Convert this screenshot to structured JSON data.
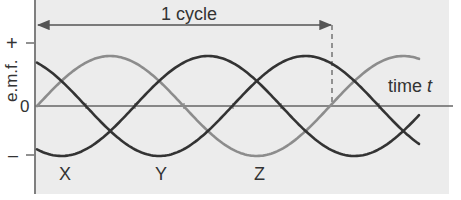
{
  "figure": {
    "type": "three-phase e.m.f. waveform diagram",
    "colors": {
      "panel_background": "#ececec",
      "axis": "#555555",
      "curve_dark": "#333333",
      "curve_light": "#8c8c8c",
      "text": "#333333"
    }
  },
  "axes": {
    "y_label": "e.m.f.",
    "y_tick_plus": "+",
    "y_tick_zero": "0",
    "y_tick_minus": "–",
    "x_label": "time",
    "x_label_var": "t"
  },
  "annotation": {
    "cycle_label": "1 cycle"
  },
  "curve_labels": {
    "x": "X",
    "y": "Y",
    "z": "Z"
  },
  "chart_data": {
    "type": "line",
    "title": "",
    "xlabel": "time t",
    "ylabel": "e.m.f.",
    "y_ticks": [
      "+",
      "0",
      "–"
    ],
    "annotations": [
      "1 cycle (double-headed arrow spanning one period, dashed marker at end)"
    ],
    "x_units": "degrees of phase",
    "xlim": [
      0,
      395
    ],
    "ylim": [
      -1,
      1
    ],
    "series": [
      {
        "name": "X",
        "phase_deg": -120,
        "color": "#333333",
        "trough_at_deg": 30,
        "peak_at_deg": 210
      },
      {
        "name": "Y",
        "phase_deg": 120,
        "color": "#333333",
        "trough_at_deg": 150,
        "peak_at_deg": 330
      },
      {
        "name": "Z",
        "phase_deg": 0,
        "color": "#8c8c8c",
        "trough_at_deg": 270,
        "peak_at_deg": 90
      }
    ],
    "x": [
      0,
      30,
      60,
      90,
      120,
      150,
      180,
      210,
      240,
      270,
      300,
      330,
      360,
      390
    ],
    "values": {
      "X": [
        -0.87,
        -1.0,
        -0.87,
        -0.5,
        0.0,
        0.5,
        0.87,
        1.0,
        0.87,
        0.5,
        0.0,
        -0.5,
        -0.87,
        -1.0
      ],
      "Y": [
        0.87,
        0.5,
        0.0,
        -0.5,
        -0.87,
        -1.0,
        -0.87,
        -0.5,
        0.0,
        0.5,
        0.87,
        1.0,
        0.87,
        0.5
      ],
      "Z": [
        0.0,
        0.5,
        0.87,
        1.0,
        0.87,
        0.5,
        0.0,
        -0.5,
        -0.87,
        -1.0,
        -0.87,
        -0.5,
        0.0,
        0.5
      ]
    },
    "grid": false,
    "legend": "inline labels X, Y, Z under troughs"
  }
}
